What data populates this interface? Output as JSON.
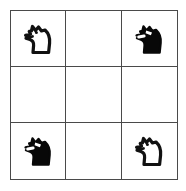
{
  "board": {
    "name": "chess-knight-grid",
    "rows": 3,
    "columns": 3,
    "colors": {
      "grid_line": "#4a4a4a",
      "cell_background": "#ffffff",
      "white_piece_fill": "#ffffff",
      "white_piece_outline": "#111111",
      "black_piece_fill": "#080808",
      "black_piece_highlight": "#ffffff"
    },
    "cells": [
      {
        "id": "cell-r1c1",
        "row": 1,
        "column": 1,
        "piece": "knight",
        "piece_color": "white",
        "icon": "chess-knight-white-icon",
        "facing": "left",
        "occupied": true
      },
      {
        "id": "cell-r1c2",
        "row": 1,
        "column": 2,
        "piece": "",
        "piece_color": "",
        "icon": "",
        "facing": "",
        "occupied": false
      },
      {
        "id": "cell-r1c3",
        "row": 1,
        "column": 3,
        "piece": "knight",
        "piece_color": "black",
        "icon": "chess-knight-black-icon",
        "facing": "left",
        "occupied": true
      },
      {
        "id": "cell-r2c1",
        "row": 2,
        "column": 1,
        "piece": "",
        "piece_color": "",
        "icon": "",
        "facing": "",
        "occupied": false
      },
      {
        "id": "cell-r2c2",
        "row": 2,
        "column": 2,
        "piece": "",
        "piece_color": "",
        "icon": "",
        "facing": "",
        "occupied": false
      },
      {
        "id": "cell-r2c3",
        "row": 2,
        "column": 3,
        "piece": "",
        "piece_color": "",
        "icon": "",
        "facing": "",
        "occupied": false
      },
      {
        "id": "cell-r3c1",
        "row": 3,
        "column": 1,
        "piece": "knight",
        "piece_color": "black",
        "icon": "chess-knight-black-icon",
        "facing": "left",
        "occupied": true
      },
      {
        "id": "cell-r3c2",
        "row": 3,
        "column": 2,
        "piece": "",
        "piece_color": "",
        "icon": "",
        "facing": "",
        "occupied": false
      },
      {
        "id": "cell-r3c3",
        "row": 3,
        "column": 3,
        "piece": "knight",
        "piece_color": "white",
        "icon": "chess-knight-white-icon",
        "facing": "left",
        "occupied": true
      }
    ]
  }
}
